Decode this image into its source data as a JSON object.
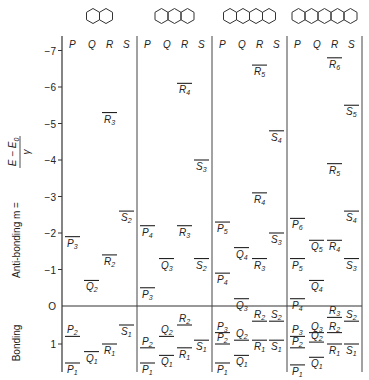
{
  "chart_data": {
    "type": "energy-level-diagram",
    "ylabel": "Anti-bonding  m = (E - E0)/γ",
    "ylabel_lower": "Bonding",
    "y_ticks": [
      "-7",
      "-6",
      "-5",
      "-4",
      "-3",
      "-2",
      "-1",
      "0",
      "1"
    ],
    "column_headers": [
      "P",
      "Q",
      "R",
      "S"
    ],
    "molecules": [
      {
        "name": "naphthalene",
        "rings": 2,
        "levels": [
          {
            "label": "R",
            "sub": "3",
            "m": -5.3,
            "col": "R"
          },
          {
            "label": "S",
            "sub": "2",
            "m": -2.6,
            "col": "S"
          },
          {
            "label": "P",
            "sub": "3",
            "m": -1.9,
            "col": "P"
          },
          {
            "label": "R",
            "sub": "2",
            "m": -1.4,
            "col": "R"
          },
          {
            "label": "Q",
            "sub": "2",
            "m": -0.7,
            "col": "Q"
          },
          {
            "label": "S",
            "sub": "1",
            "m": 0.5,
            "col": "S"
          },
          {
            "label": "P",
            "sub": "2",
            "m": 0.8,
            "col": "P"
          },
          {
            "label": "R",
            "sub": "1",
            "m": 1.0,
            "col": "R"
          },
          {
            "label": "Q",
            "sub": "1",
            "m": 1.2,
            "col": "Q"
          },
          {
            "label": "P",
            "sub": "1",
            "m": 1.5,
            "col": "P"
          }
        ]
      },
      {
        "name": "anthracene",
        "rings": 3,
        "levels": [
          {
            "label": "R",
            "sub": "4",
            "m": -6.1,
            "col": "R"
          },
          {
            "label": "S",
            "sub": "3",
            "m": -4.0,
            "col": "S"
          },
          {
            "label": "P",
            "sub": "4",
            "m": -2.2,
            "col": "P"
          },
          {
            "label": "R",
            "sub": "3",
            "m": -2.2,
            "col": "R"
          },
          {
            "label": "Q",
            "sub": "3",
            "m": -1.3,
            "col": "Q"
          },
          {
            "label": "S",
            "sub": "2",
            "m": -1.3,
            "col": "S"
          },
          {
            "label": "P",
            "sub": "3",
            "m": -0.5,
            "col": "P"
          },
          {
            "label": "R",
            "sub": "2",
            "m": 0.5,
            "col": "R"
          },
          {
            "label": "Q",
            "sub": "2",
            "m": 0.8,
            "col": "Q"
          },
          {
            "label": "S",
            "sub": "1",
            "m": 0.9,
            "col": "S"
          },
          {
            "label": "P",
            "sub": "2",
            "m": 1.1,
            "col": "P"
          },
          {
            "label": "R",
            "sub": "1",
            "m": 1.1,
            "col": "R"
          },
          {
            "label": "Q",
            "sub": "1",
            "m": 1.3,
            "col": "Q"
          },
          {
            "label": "P",
            "sub": "1",
            "m": 1.5,
            "col": "P"
          }
        ]
      },
      {
        "name": "tetracene",
        "rings": 4,
        "levels": [
          {
            "label": "R",
            "sub": "5",
            "m": -6.6,
            "col": "R"
          },
          {
            "label": "S",
            "sub": "4",
            "m": -4.8,
            "col": "S"
          },
          {
            "label": "R",
            "sub": "4",
            "m": -3.1,
            "col": "R"
          },
          {
            "label": "P",
            "sub": "5",
            "m": -2.3,
            "col": "P"
          },
          {
            "label": "S",
            "sub": "3",
            "m": -2.0,
            "col": "S"
          },
          {
            "label": "Q",
            "sub": "4",
            "m": -1.6,
            "col": "Q"
          },
          {
            "label": "R",
            "sub": "3",
            "m": -1.3,
            "col": "R"
          },
          {
            "label": "P",
            "sub": "4",
            "m": -0.9,
            "col": "P"
          },
          {
            "label": "Q",
            "sub": "3",
            "m": -0.2,
            "col": "Q"
          },
          {
            "label": "R",
            "sub": "2",
            "m": 0.4,
            "col": "R"
          },
          {
            "label": "S",
            "sub": "2",
            "m": 0.4,
            "col": "S"
          },
          {
            "label": "P",
            "sub": "3",
            "m": 0.7,
            "col": "P"
          },
          {
            "label": "Q",
            "sub": "2",
            "m": 0.9,
            "col": "Q"
          },
          {
            "label": "R",
            "sub": "1",
            "m": 0.9,
            "col": "R"
          },
          {
            "label": "S",
            "sub": "1",
            "m": 0.9,
            "col": "S"
          },
          {
            "label": "P",
            "sub": "2",
            "m": 1.0,
            "col": "P"
          },
          {
            "label": "Q",
            "sub": "1",
            "m": 1.3,
            "col": "Q"
          },
          {
            "label": "P",
            "sub": "1",
            "m": 1.5,
            "col": "P"
          }
        ]
      },
      {
        "name": "pentacene",
        "rings": 5,
        "levels": [
          {
            "label": "R",
            "sub": "6",
            "m": -6.8,
            "col": "R"
          },
          {
            "label": "S",
            "sub": "5",
            "m": -5.5,
            "col": "S"
          },
          {
            "label": "R",
            "sub": "5",
            "m": -3.9,
            "col": "R"
          },
          {
            "label": "S",
            "sub": "4",
            "m": -2.6,
            "col": "S"
          },
          {
            "label": "P",
            "sub": "6",
            "m": -2.4,
            "col": "P"
          },
          {
            "label": "Q",
            "sub": "5",
            "m": -1.8,
            "col": "Q"
          },
          {
            "label": "R",
            "sub": "4",
            "m": -1.8,
            "col": "R"
          },
          {
            "label": "P",
            "sub": "5",
            "m": -1.3,
            "col": "P"
          },
          {
            "label": "S",
            "sub": "3",
            "m": -1.3,
            "col": "S"
          },
          {
            "label": "Q",
            "sub": "4",
            "m": -0.7,
            "col": "Q"
          },
          {
            "label": "P",
            "sub": "4",
            "m": -0.2,
            "col": "P"
          },
          {
            "label": "R",
            "sub": "3",
            "m": 0.3,
            "col": "R"
          },
          {
            "label": "S",
            "sub": "2",
            "m": 0.4,
            "col": "S"
          },
          {
            "label": "Q",
            "sub": "3",
            "m": 0.7,
            "col": "Q"
          },
          {
            "label": "R",
            "sub": "2",
            "m": 0.7,
            "col": "R"
          },
          {
            "label": "P",
            "sub": "3",
            "m": 0.8,
            "col": "P"
          },
          {
            "label": "Q",
            "sub": "2",
            "m": 0.95,
            "col": "Q"
          },
          {
            "label": "P",
            "sub": "2",
            "m": 1.1,
            "col": "P"
          },
          {
            "label": "R",
            "sub": "1",
            "m": 1.0,
            "col": "R"
          },
          {
            "label": "S",
            "sub": "1",
            "m": 1.0,
            "col": "S"
          },
          {
            "label": "Q",
            "sub": "1",
            "m": 1.35,
            "col": "Q"
          },
          {
            "label": "P",
            "sub": "1",
            "m": 1.55,
            "col": "P"
          }
        ]
      }
    ]
  },
  "axis": {
    "y_label": "Anti-bonding  m =",
    "frac_num": "E − E",
    "frac_num_sub": "0",
    "frac_den": "γ",
    "bonding_label": "Bonding"
  }
}
